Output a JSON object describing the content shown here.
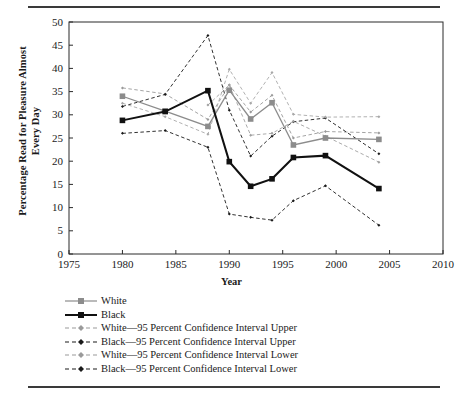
{
  "chart_data": {
    "type": "line",
    "title": "",
    "xlabel": "Year",
    "ylabel": "Percentage Read for Pleasure Almost Every Day",
    "xlim": [
      1975,
      2010
    ],
    "ylim": [
      0,
      50
    ],
    "xticks": [
      1975,
      1980,
      1985,
      1990,
      1995,
      2000,
      2005,
      2010
    ],
    "yticks": [
      0,
      5,
      10,
      15,
      20,
      25,
      30,
      35,
      40,
      45,
      50
    ],
    "grid": false,
    "legend_position": "below-left",
    "series": [
      {
        "name": "White",
        "style": "solid",
        "color": "#8c8c8c",
        "marker": "square",
        "x": [
          1980,
          1984,
          1988,
          1990,
          1992,
          1994,
          1996,
          1999,
          2004
        ],
        "values": [
          34.0,
          30.8,
          27.5,
          35.3,
          29.1,
          32.6,
          23.5,
          25.0,
          24.7
        ]
      },
      {
        "name": "Black",
        "style": "solid",
        "color": "#111111",
        "marker": "square",
        "x": [
          1980,
          1984,
          1988,
          1990,
          1992,
          1994,
          1996,
          1999,
          2004
        ],
        "values": [
          28.8,
          30.7,
          35.2,
          19.9,
          14.6,
          16.2,
          20.8,
          21.2,
          14.1
        ]
      },
      {
        "name": "White—95 Percent Confidence Interval Upper",
        "style": "dashed",
        "color": "#9a9a9a",
        "marker": "diamond",
        "x": [
          1980,
          1984,
          1988,
          1990,
          1992,
          1994,
          1996,
          1999,
          2004
        ],
        "values": [
          35.8,
          34.5,
          29.0,
          36.4,
          30.6,
          34.2,
          25.0,
          26.4,
          26.1
        ]
      },
      {
        "name": "Black—95 Percent Confidence Interval Upper",
        "style": "dashed",
        "color": "#1a1a1a",
        "marker": "diamond",
        "x": [
          1980,
          1984,
          1988,
          1990,
          1992,
          1994,
          1996,
          1999,
          2004
        ],
        "values": [
          31.8,
          34.4,
          47.1,
          31.0,
          21.1,
          25.4,
          28.5,
          29.3,
          21.6
        ]
      },
      {
        "name": "White—95 Percent Confidence Interval Lower",
        "style": "dashed",
        "color": "#a8a8a8",
        "marker": "diamond",
        "x": [
          1980,
          1984,
          1988,
          1990,
          1992,
          1994,
          1996,
          1999,
          2004
        ],
        "values": [
          32.5,
          29.6,
          25.8,
          39.8,
          32.5,
          39.1,
          30.1,
          29.5,
          29.6
        ]
      },
      {
        "name": "Black—95 Percent Confidence Interval Lower",
        "style": "dashed",
        "color": "#1a1a1a",
        "marker": "diamond",
        "x": [
          1980,
          1984,
          1988,
          1990,
          1992,
          1994,
          1996,
          1999,
          2004
        ],
        "values": [
          26.0,
          26.6,
          23.0,
          8.6,
          7.9,
          7.3,
          11.5,
          14.7,
          6.2
        ]
      }
    ],
    "extra_points": {
      "white_upper_trace_b": {
        "x": [
          1988,
          1990,
          1992,
          1994,
          1996,
          1999,
          2004
        ],
        "values": [
          32.1,
          36.4,
          25.6,
          26.0,
          28.6,
          25.4,
          19.8
        ]
      }
    }
  },
  "legend": {
    "entries": [
      {
        "label": "White",
        "style": "solid",
        "color": "#8c8c8c",
        "marker": "square"
      },
      {
        "label": "Black",
        "style": "solid",
        "color": "#111111",
        "marker": "square"
      },
      {
        "label": "White—95 Percent Confidence Interval Upper",
        "style": "dashed",
        "color": "#9a9a9a",
        "marker": "diamond"
      },
      {
        "label": "Black—95 Percent Confidence Interval Upper",
        "style": "dashed",
        "color": "#1a1a1a",
        "marker": "diamond"
      },
      {
        "label": "White—95 Percent Confidence Interval Lower",
        "style": "dashed",
        "color": "#9a9a9a",
        "marker": "diamond"
      },
      {
        "label": "Black—95 Percent Confidence Interval Lower",
        "style": "dashed",
        "color": "#1a1a1a",
        "marker": "diamond"
      }
    ]
  },
  "axes": {
    "x_title": "Year",
    "y_title": "Percentage Read for Pleasure Almost Every Day"
  },
  "colors": {
    "white_series": "#8c8c8c",
    "black_series": "#111111",
    "axis": "#2b2b2b",
    "rule": "#3a3a3a"
  }
}
